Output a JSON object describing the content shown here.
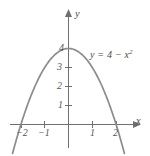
{
  "chart_data": {
    "type": "line",
    "title": "",
    "subtitle": "",
    "xlabel": "x",
    "ylabel": "y",
    "equation": "y = 4 − x²",
    "equation_parts": {
      "lhs": "y = 4 − x",
      "exponent": "2"
    },
    "function": "y = 4 - x^2",
    "grid": false,
    "legend": "none",
    "annotations": [
      {
        "text": "y = 4 − x²",
        "x": 1.0,
        "y": 3.8
      }
    ],
    "xlim": [
      -2.7,
      2.9
    ],
    "ylim": [
      -1.4,
      5.0
    ],
    "xticks": [
      -2,
      -1,
      1,
      2
    ],
    "xtick_labels": [
      "−2",
      "−1",
      "1",
      "2"
    ],
    "yticks": [
      1,
      2,
      3,
      4
    ],
    "ytick_labels": [
      "1",
      "2",
      "3",
      "4"
    ],
    "x_axis_arrow": true,
    "y_axis_arrow": true,
    "roots": [
      -2,
      2
    ],
    "vertex": [
      0,
      4
    ],
    "x": [
      -2.35,
      -2.2,
      -2.0,
      -1.75,
      -1.5,
      -1.25,
      -1.0,
      -0.75,
      -0.5,
      -0.25,
      0,
      0.25,
      0.5,
      0.75,
      1.0,
      1.25,
      1.5,
      1.75,
      2.0,
      2.2,
      2.35
    ],
    "y": [
      -1.52,
      -0.84,
      0,
      0.94,
      1.75,
      2.44,
      3.0,
      3.44,
      3.75,
      3.94,
      4.0,
      3.94,
      3.75,
      3.44,
      3.0,
      2.44,
      1.75,
      0.94,
      0,
      -0.84,
      -1.52
    ],
    "colors": {
      "curve": "#8c8c8c",
      "axis": "#6f6f6f",
      "text": "#4a4a4a",
      "tick_text": "#555555",
      "background": "#ffffff"
    }
  },
  "labels": {
    "y_axis": "y",
    "x_axis": "x",
    "y4": "4",
    "y3": "3",
    "y2": "2",
    "y1": "1",
    "xm2": "−2",
    "xm1": "−1",
    "xp1": "1",
    "xp2": "2",
    "equation_main": "y = 4 − x",
    "equation_exp": "2"
  }
}
